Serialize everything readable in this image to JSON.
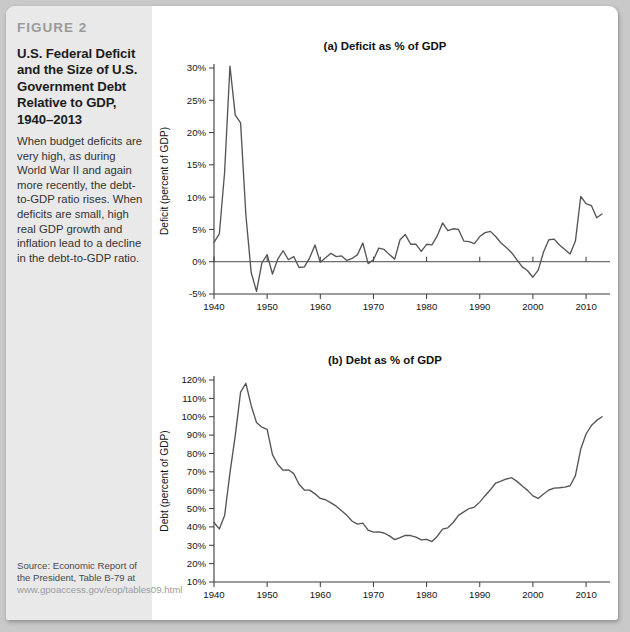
{
  "figure": {
    "label": "FIGURE 2",
    "title": "U.S. Federal Deficit and the Size of U.S. Government Debt Relative to GDP, 1940–2013",
    "description": "When budget deficits are very high, as during World War II and again more recently, the debt-to-GDP ratio rises. When deficits are small, high real GDP growth and inflation lead to a decline in the debt-to-GDP ratio.",
    "source_prefix": "Source: Economic Report of the President, Table B-79 at ",
    "source_url": "www.gpoaccess.gov/eop/tables09.html"
  },
  "chart_data": [
    {
      "type": "line",
      "title": "(a) Deficit as % of GDP",
      "xlabel": "",
      "ylabel": "Deficit (percent of GDP)",
      "xlim": [
        1940,
        2013
      ],
      "ylim": [
        -5,
        30
      ],
      "xticks": [
        1940,
        1950,
        1960,
        1970,
        1980,
        1990,
        2000,
        2010
      ],
      "yticks": [
        -5,
        0,
        5,
        10,
        15,
        20,
        25,
        30
      ],
      "ytick_labels": [
        "-5%",
        "0%",
        "5%",
        "10%",
        "15%",
        "20%",
        "25%",
        "30%"
      ],
      "grid": false,
      "zero_line": true,
      "x": [
        1940,
        1941,
        1942,
        1943,
        1944,
        1945,
        1946,
        1947,
        1948,
        1949,
        1950,
        1951,
        1952,
        1953,
        1954,
        1955,
        1956,
        1957,
        1958,
        1959,
        1960,
        1961,
        1962,
        1963,
        1964,
        1965,
        1966,
        1967,
        1968,
        1969,
        1970,
        1971,
        1972,
        1973,
        1974,
        1975,
        1976,
        1977,
        1978,
        1979,
        1980,
        1981,
        1982,
        1983,
        1984,
        1985,
        1986,
        1987,
        1988,
        1989,
        1990,
        1991,
        1992,
        1993,
        1994,
        1995,
        1996,
        1997,
        1998,
        1999,
        2000,
        2001,
        2002,
        2003,
        2004,
        2005,
        2006,
        2007,
        2008,
        2009,
        2010,
        2011,
        2012,
        2013
      ],
      "values": [
        3.0,
        4.3,
        13.9,
        30.3,
        22.7,
        21.5,
        7.2,
        -1.7,
        -4.6,
        -0.2,
        1.1,
        -1.9,
        0.4,
        1.7,
        0.3,
        0.8,
        -0.9,
        -0.8,
        0.6,
        2.6,
        -0.1,
        0.6,
        1.3,
        0.8,
        0.9,
        0.2,
        0.5,
        1.1,
        2.9,
        -0.3,
        0.3,
        2.1,
        1.9,
        1.1,
        0.4,
        3.4,
        4.2,
        2.7,
        2.7,
        1.6,
        2.7,
        2.6,
        4.0,
        6.0,
        4.8,
        5.1,
        5.0,
        3.2,
        3.1,
        2.8,
        3.9,
        4.5,
        4.7,
        3.9,
        2.9,
        2.2,
        1.4,
        0.3,
        -0.8,
        -1.4,
        -2.4,
        -1.3,
        1.5,
        3.4,
        3.5,
        2.6,
        1.9,
        1.2,
        3.2,
        10.1,
        9.0,
        8.7,
        6.8,
        7.4
      ]
    },
    {
      "type": "line",
      "title": "(b) Debt as % of GDP",
      "xlabel": "",
      "ylabel": "Debt (percent of GDP)",
      "xlim": [
        1940,
        2013
      ],
      "ylim": [
        10,
        120
      ],
      "xticks": [
        1940,
        1950,
        1960,
        1970,
        1980,
        1990,
        2000,
        2010
      ],
      "yticks": [
        10,
        20,
        30,
        40,
        50,
        60,
        70,
        80,
        90,
        100,
        110,
        120
      ],
      "ytick_labels": [
        "10%",
        "20%",
        "30%",
        "40%",
        "50%",
        "60%",
        "70%",
        "80%",
        "90%",
        "100%",
        "110%",
        "120%"
      ],
      "grid": false,
      "zero_line": false,
      "x": [
        1940,
        1941,
        1942,
        1943,
        1944,
        1945,
        1946,
        1947,
        1948,
        1949,
        1950,
        1951,
        1952,
        1953,
        1954,
        1955,
        1956,
        1957,
        1958,
        1959,
        1960,
        1961,
        1962,
        1963,
        1964,
        1965,
        1966,
        1967,
        1968,
        1969,
        1970,
        1971,
        1972,
        1973,
        1974,
        1975,
        1976,
        1977,
        1978,
        1979,
        1980,
        1981,
        1982,
        1983,
        1984,
        1985,
        1986,
        1987,
        1988,
        1989,
        1990,
        1991,
        1992,
        1993,
        1994,
        1995,
        1996,
        1997,
        1998,
        1999,
        2000,
        2001,
        2002,
        2003,
        2004,
        2005,
        2006,
        2007,
        2008,
        2009,
        2010,
        2011,
        2012,
        2013
      ],
      "values": [
        42.4,
        38.9,
        46.2,
        69.4,
        89.7,
        113.4,
        118.2,
        106.0,
        96.8,
        94.3,
        93.1,
        79.4,
        74.0,
        70.9,
        71.1,
        69.0,
        63.2,
        60.1,
        60.0,
        58.0,
        55.5,
        54.8,
        53.1,
        51.3,
        48.8,
        46.3,
        43.1,
        41.5,
        42.1,
        38.2,
        37.2,
        37.3,
        36.7,
        35.1,
        33.1,
        34.2,
        35.4,
        35.3,
        34.4,
        32.9,
        33.2,
        32.0,
        34.8,
        38.8,
        39.5,
        42.4,
        46.3,
        48.2,
        50.0,
        50.8,
        53.5,
        57.0,
        60.2,
        63.9,
        64.9,
        66.1,
        66.8,
        64.8,
        62.3,
        59.9,
        56.9,
        55.5,
        57.9,
        60.1,
        61.1,
        61.3,
        61.7,
        62.4,
        67.9,
        82.4,
        90.6,
        95.2,
        98.0,
        100.0
      ]
    }
  ]
}
